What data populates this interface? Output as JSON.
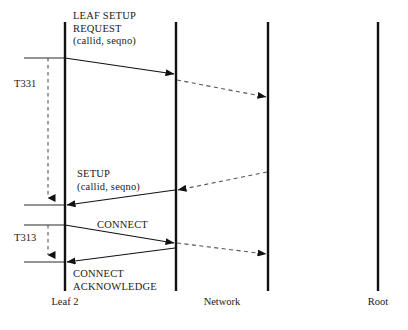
{
  "diagram": {
    "type": "sequence-diagram",
    "colors": {
      "line": "#111111",
      "dashed": "#555555",
      "text": "#1a1a1a",
      "background": "#ffffff"
    },
    "lifelines": [
      {
        "id": "leaf2",
        "label": "Leaf 2",
        "x": 65,
        "y_top": 22,
        "y_bottom": 291,
        "label_x": 65,
        "label_y": 296
      },
      {
        "id": "network-left",
        "label": "",
        "x": 176,
        "y_top": 22,
        "y_bottom": 291
      },
      {
        "id": "network-right",
        "label": "",
        "x": 268,
        "y_top": 22,
        "y_bottom": 291
      },
      {
        "id": "root",
        "label": "Root",
        "x": 378,
        "y_top": 22,
        "y_bottom": 291,
        "label_x": 378,
        "label_y": 296
      }
    ],
    "group_labels": [
      {
        "id": "network",
        "label": "Network",
        "x": 222,
        "y": 296
      }
    ],
    "messages": [
      {
        "id": "leaf-setup-request",
        "label_lines": [
          "LEAF SETUP",
          "REQUEST",
          "(callid, seqno)"
        ],
        "label_x": 73,
        "label_y": 10,
        "style": "solid",
        "from": "leaf2",
        "to": "network-left",
        "x1": 65,
        "y1": 58,
        "x2": 174,
        "y2": 74
      },
      {
        "id": "setup-request-relay",
        "label_lines": [],
        "style": "dashed",
        "from": "network-left",
        "to": "network-right",
        "x1": 177,
        "y1": 80,
        "x2": 266,
        "y2": 97
      },
      {
        "id": "setup-response-relay",
        "label_lines": [],
        "style": "dashed",
        "from": "network-right",
        "to": "network-left",
        "x1": 267,
        "y1": 172,
        "x2": 178,
        "y2": 190
      },
      {
        "id": "setup",
        "label_lines": [
          "SETUP",
          "(callid, seqno)"
        ],
        "label_x": 77,
        "label_y": 168,
        "style": "solid",
        "from": "network-left",
        "to": "leaf2",
        "x1": 175,
        "y1": 190,
        "x2": 67,
        "y2": 205
      },
      {
        "id": "connect",
        "label_lines": [
          "CONNECT"
        ],
        "label_x": 97,
        "label_y": 219,
        "style": "solid",
        "from": "leaf2",
        "to": "network-left",
        "x1": 65,
        "y1": 225,
        "x2": 174,
        "y2": 243
      },
      {
        "id": "connect-relay",
        "label_lines": [],
        "style": "dashed",
        "from": "network-left",
        "to": "network-right",
        "x1": 177,
        "y1": 243,
        "x2": 266,
        "y2": 254
      },
      {
        "id": "connect-acknowledge",
        "label_lines": [
          "CONNECT",
          "ACKNOWLEDGE"
        ],
        "label_x": 73,
        "label_y": 268,
        "style": "solid",
        "from": "network-left",
        "to": "leaf2",
        "x1": 175,
        "y1": 248,
        "x2": 67,
        "y2": 262
      }
    ],
    "timers": [
      {
        "id": "T331",
        "label": "T331",
        "label_x": 14,
        "label_y": 78,
        "x": 48,
        "y_start": 58,
        "y_end": 205,
        "tick_top_x1": 24,
        "tick_top_x2": 65,
        "tick_bottom_x1": 24,
        "tick_bottom_x2": 65
      },
      {
        "id": "T313",
        "label": "T313",
        "label_x": 14,
        "label_y": 232,
        "x": 48,
        "y_start": 225,
        "y_end": 262,
        "tick_top_x1": 24,
        "tick_top_x2": 65,
        "tick_bottom_x1": 24,
        "tick_bottom_x2": 65
      }
    ]
  }
}
